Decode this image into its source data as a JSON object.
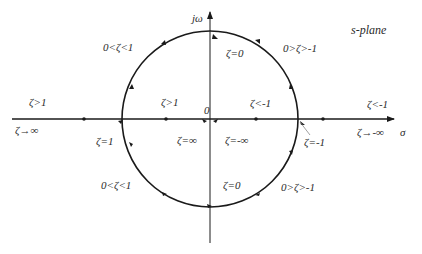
{
  "diagram": {
    "title": "s-plane",
    "axes": {
      "imag_label": "jω",
      "real_label": "σ",
      "origin_label": "0"
    },
    "labels": {
      "upper_left_arc": "0<ζ<1",
      "upper_right_arc": "0>ζ>-1",
      "lower_left_arc": "0<ζ<1",
      "lower_right_arc": "0>ζ>-1",
      "top_point": "ζ=0",
      "bottom_point": "ζ=0",
      "left_outer": "ζ>1",
      "left_inner": "ζ>1",
      "right_inner": "ζ<-1",
      "right_outer": "ζ<-1",
      "left_infinity": "ζ→∞",
      "right_infinity": "ζ→-∞",
      "left_intersection": "ζ=1",
      "right_intersection": "ζ=-1",
      "origin_left": "ζ=∞",
      "origin_right": "ζ=-∞"
    },
    "colors": {
      "stroke": "#1a1a1a",
      "text": "#2a2a2a",
      "background": "#ffffff"
    }
  }
}
